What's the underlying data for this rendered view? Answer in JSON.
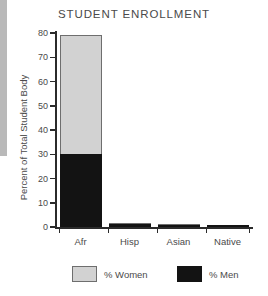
{
  "chart_data": {
    "type": "bar",
    "subtype": "stacked-bar",
    "title": "STUDENT ENROLLMENT",
    "xlabel": "",
    "ylabel": "Percent of Total Student Body",
    "categories": [
      "Afr",
      "Hisp",
      "Asian",
      "Native"
    ],
    "series": [
      {
        "name": "% Women",
        "color": "#d2d2d2",
        "values": [
          49,
          0.4,
          0.3,
          0.2
        ]
      },
      {
        "name": "% Men",
        "color": "#131313",
        "values": [
          30,
          1.1,
          1.0,
          0.8
        ]
      }
    ],
    "totals": [
      79,
      1.5,
      1.3,
      1.0
    ],
    "ylim": [
      0,
      80
    ],
    "yticks": [
      0,
      10,
      20,
      30,
      40,
      50,
      60,
      70,
      80
    ],
    "ytick_labels": [
      "0",
      "10",
      "20",
      "30",
      "40",
      "50",
      "60",
      "70",
      "80"
    ],
    "grid": false,
    "legend_position": "bottom",
    "stack_order": [
      "% Men",
      "% Women"
    ]
  },
  "legend": {
    "entries": [
      {
        "label": "% Women",
        "swatch": "light-gray"
      },
      {
        "label": "% Men",
        "swatch": "black"
      }
    ]
  },
  "colors": {
    "women": "#d2d2d2",
    "men": "#131313",
    "axis": "#2b2b2b",
    "text": "#4a4a4a",
    "background": "#ffffff",
    "edge_strip": "#b9b9b9"
  }
}
